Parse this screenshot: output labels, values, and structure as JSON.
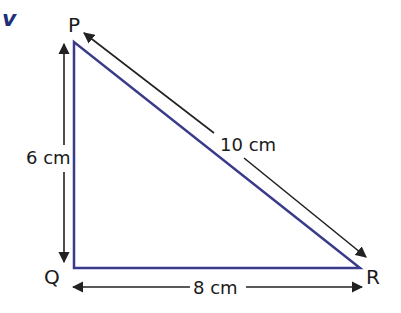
{
  "figure": {
    "question_mark": "v",
    "shape": "right triangle",
    "vertices": {
      "P": {
        "label": "P"
      },
      "Q": {
        "label": "Q"
      },
      "R": {
        "label": "R"
      }
    },
    "sides": {
      "PQ": {
        "label": "6 cm"
      },
      "QR": {
        "label": "8 cm"
      },
      "PR": {
        "label": "10 cm"
      }
    },
    "colors": {
      "triangle_stroke": "#3a3a8a",
      "arrow_stroke": "#222222",
      "text": "#1a1a1a",
      "question_mark": "#1f2f7a"
    }
  }
}
